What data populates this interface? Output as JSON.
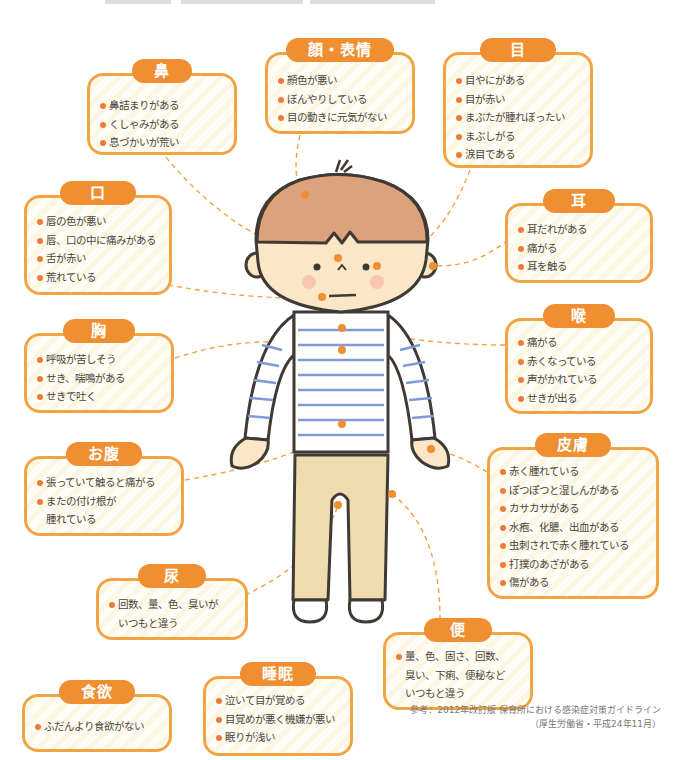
{
  "header": {
    "clipped_text_visible": false
  },
  "cards": {
    "nose": {
      "title": "鼻",
      "items": [
        "鼻詰まりがある",
        "くしゃみがある",
        "息づかいが荒い"
      ]
    },
    "face": {
      "title": "顔・表情",
      "items": [
        "顔色が悪い",
        "ぼんやりしている",
        "目の動きに元気がない"
      ]
    },
    "eye": {
      "title": "目",
      "items": [
        "目やにがある",
        "目が赤い",
        "まぶたが腫れぼったい",
        "まぶしがる",
        "涙目である"
      ]
    },
    "mouth": {
      "title": "口",
      "items": [
        "唇の色が悪い",
        "唇、口の中に痛みがある",
        "舌が赤い",
        "荒れている"
      ]
    },
    "ear": {
      "title": "耳",
      "items": [
        "耳だれがある",
        "痛がる",
        "耳を触る"
      ]
    },
    "chest": {
      "title": "胸",
      "items": [
        "呼吸が苦しそう",
        "せき、喘鳴がある",
        "せきで吐く"
      ],
      "ruby": {
        "word": "喘鳴",
        "reading": "ぜんめい"
      }
    },
    "throat": {
      "title": "喉",
      "items": [
        "痛がる",
        "赤くなっている",
        "声がかれている",
        "せきが出る"
      ]
    },
    "belly": {
      "title": "お腹",
      "items": [
        "張っていて触ると痛がる",
        "またの付け根が",
        "腫れている"
      ]
    },
    "skin": {
      "title": "皮膚",
      "items": [
        "赤く腫れている",
        "ぽつぽつと湿しんがある",
        "カサカサがある",
        "水疱、化膿、出血がある",
        "虫刺されで赤く腫れている",
        "打撲のあざがある",
        "傷がある"
      ]
    },
    "urine": {
      "title": "尿",
      "items": [
        "回数、量、色、臭いが",
        "いつもと違う"
      ]
    },
    "stool": {
      "title": "便",
      "items": [
        "量、色、固さ、回数、",
        "臭い、下痢、便秘など",
        "いつもと違う"
      ]
    },
    "appetite": {
      "title": "食欲",
      "items": [
        "ふだんより食欲がない"
      ]
    },
    "sleep": {
      "title": "睡眠",
      "items": [
        "泣いて目が覚める",
        "目覚めが悪く機嫌が悪い",
        "眠りが浅い"
      ]
    }
  },
  "reference": {
    "line1": "参考：2012年改訂版 保育所における感染症対策ガイドライン",
    "line2": "（厚生労働省・平成24年11月）"
  },
  "colors": {
    "accent": "#ef8f31",
    "border": "#f0a444",
    "bullet": "#ef7a3a",
    "hair": "#dca27c",
    "skin": "#fbe6c8",
    "pants": "#eedcae",
    "stripe": "#7f9ad6",
    "outline": "#3f3a34"
  }
}
